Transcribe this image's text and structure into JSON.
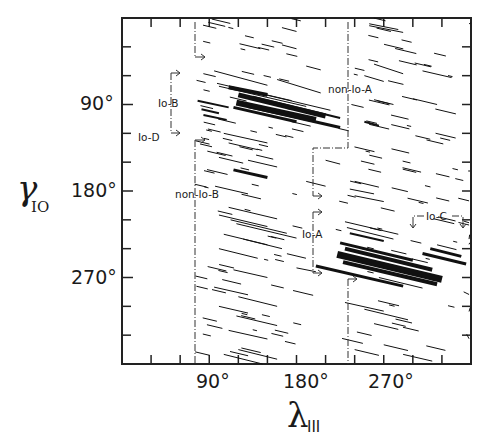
{
  "chart_data": {
    "type": "scatter",
    "title": "",
    "xlabel": "λIII",
    "xlabel_symbol": "λ",
    "xlabel_subscript": "III",
    "ylabel": "γIO",
    "ylabel_symbol": "γ",
    "ylabel_subscript": "IO",
    "xlim": [
      0,
      360
    ],
    "ylim": [
      360,
      0
    ],
    "y_inverted": true,
    "grid": false,
    "legend": null,
    "x_ticks": [
      {
        "value": 90,
        "label": "90°"
      },
      {
        "value": 180,
        "label": "180°"
      },
      {
        "value": 270,
        "label": "270°"
      }
    ],
    "y_ticks": [
      {
        "value": 90,
        "label": "90°"
      },
      {
        "value": 180,
        "label": "180°"
      },
      {
        "value": 270,
        "label": "270°"
      }
    ],
    "minor_tick_step": 30,
    "regions": [
      {
        "name": "Io-A",
        "lambda_range": [
          200,
          270
        ],
        "gamma_range": [
          220,
          290
        ]
      },
      {
        "name": "Io-B",
        "lambda_range": [
          100,
          180
        ],
        "gamma_range": [
          60,
          100
        ]
      },
      {
        "name": "Io-C",
        "lambda_range": [
          300,
          350
        ],
        "gamma_range": [
          230,
          250
        ]
      },
      {
        "name": "Io-D",
        "lambda_range": [
          50,
          105
        ],
        "gamma_range": [
          95,
          125
        ]
      },
      {
        "name": "non-Io-A",
        "lambda_range": [
          225,
          360
        ],
        "gamma_range": [
          0,
          360
        ]
      },
      {
        "name": "non-Io-B",
        "lambda_range": [
          75,
          180
        ],
        "gamma_range": [
          0,
          360
        ]
      }
    ],
    "annotations": [
      {
        "text": "Io-B",
        "lambda": 52,
        "gamma": 90
      },
      {
        "text": "Io-D",
        "lambda": 18,
        "gamma": 123
      },
      {
        "text": "non-Io-B",
        "lambda": 76,
        "gamma": 185
      },
      {
        "text": "non-Io-A",
        "lambda": 212,
        "gamma": 80
      },
      {
        "text": "Io-A",
        "lambda": 185,
        "gamma": 245
      },
      {
        "text": "Io-C",
        "lambda": 318,
        "gamma": 224
      }
    ],
    "strokes": [
      {
        "x1": 95,
        "y1": 55,
        "x2": 150,
        "y2": 70,
        "w": 1
      },
      {
        "x1": 98,
        "y1": 68,
        "x2": 175,
        "y2": 86,
        "w": 1
      },
      {
        "x1": 100,
        "y1": 71,
        "x2": 190,
        "y2": 92,
        "w": 1
      },
      {
        "x1": 110,
        "y1": 72,
        "x2": 150,
        "y2": 80,
        "w": 4
      },
      {
        "x1": 120,
        "y1": 80,
        "x2": 210,
        "y2": 102,
        "w": 5
      },
      {
        "x1": 118,
        "y1": 88,
        "x2": 200,
        "y2": 106,
        "w": 6
      },
      {
        "x1": 115,
        "y1": 93,
        "x2": 180,
        "y2": 108,
        "w": 3
      },
      {
        "x1": 130,
        "y1": 92,
        "x2": 225,
        "y2": 114,
        "w": 3
      },
      {
        "x1": 135,
        "y1": 82,
        "x2": 225,
        "y2": 104,
        "w": 2
      },
      {
        "x1": 78,
        "y1": 86,
        "x2": 110,
        "y2": 93,
        "w": 2
      },
      {
        "x1": 82,
        "y1": 95,
        "x2": 100,
        "y2": 99,
        "w": 2
      },
      {
        "x1": 84,
        "y1": 101,
        "x2": 108,
        "y2": 106,
        "w": 2
      },
      {
        "x1": 140,
        "y1": 78,
        "x2": 215,
        "y2": 96,
        "w": 1
      },
      {
        "x1": 160,
        "y1": 64,
        "x2": 205,
        "y2": 78,
        "w": 1
      },
      {
        "x1": 105,
        "y1": 120,
        "x2": 150,
        "y2": 130,
        "w": 1
      },
      {
        "x1": 110,
        "y1": 130,
        "x2": 140,
        "y2": 137,
        "w": 1
      },
      {
        "x1": 115,
        "y1": 158,
        "x2": 150,
        "y2": 166,
        "w": 3
      },
      {
        "x1": 100,
        "y1": 145,
        "x2": 125,
        "y2": 151,
        "w": 1
      },
      {
        "x1": 130,
        "y1": 148,
        "x2": 160,
        "y2": 155,
        "w": 1
      },
      {
        "x1": 96,
        "y1": 175,
        "x2": 130,
        "y2": 183,
        "w": 1
      },
      {
        "x1": 110,
        "y1": 197,
        "x2": 160,
        "y2": 209,
        "w": 1
      },
      {
        "x1": 100,
        "y1": 205,
        "x2": 150,
        "y2": 217,
        "w": 1
      },
      {
        "x1": 112,
        "y1": 210,
        "x2": 170,
        "y2": 224,
        "w": 1
      },
      {
        "x1": 118,
        "y1": 214,
        "x2": 180,
        "y2": 229,
        "w": 1
      },
      {
        "x1": 105,
        "y1": 225,
        "x2": 150,
        "y2": 236,
        "w": 1
      },
      {
        "x1": 125,
        "y1": 230,
        "x2": 165,
        "y2": 240,
        "w": 1
      },
      {
        "x1": 100,
        "y1": 240,
        "x2": 140,
        "y2": 250,
        "w": 1
      },
      {
        "x1": 115,
        "y1": 262,
        "x2": 150,
        "y2": 270,
        "w": 1
      },
      {
        "x1": 95,
        "y1": 280,
        "x2": 130,
        "y2": 288,
        "w": 1
      },
      {
        "x1": 120,
        "y1": 290,
        "x2": 160,
        "y2": 300,
        "w": 1
      },
      {
        "x1": 100,
        "y1": 300,
        "x2": 130,
        "y2": 307,
        "w": 1
      },
      {
        "x1": 118,
        "y1": 310,
        "x2": 160,
        "y2": 320,
        "w": 1
      },
      {
        "x1": 110,
        "y1": 325,
        "x2": 150,
        "y2": 334,
        "w": 1
      },
      {
        "x1": 120,
        "y1": 345,
        "x2": 160,
        "y2": 355,
        "w": 1
      },
      {
        "x1": 105,
        "y1": 350,
        "x2": 145,
        "y2": 360,
        "w": 1
      },
      {
        "x1": 165,
        "y1": 28,
        "x2": 180,
        "y2": 32,
        "w": 1
      },
      {
        "x1": 190,
        "y1": 50,
        "x2": 205,
        "y2": 54,
        "w": 1
      },
      {
        "x1": 165,
        "y1": 10,
        "x2": 180,
        "y2": 14,
        "w": 1
      },
      {
        "x1": 210,
        "y1": 148,
        "x2": 225,
        "y2": 152,
        "w": 1
      },
      {
        "x1": 190,
        "y1": 170,
        "x2": 210,
        "y2": 175,
        "w": 1
      },
      {
        "x1": 180,
        "y1": 260,
        "x2": 200,
        "y2": 264,
        "w": 1
      },
      {
        "x1": 255,
        "y1": 8,
        "x2": 290,
        "y2": 15,
        "w": 1
      },
      {
        "x1": 255,
        "y1": 6,
        "x2": 285,
        "y2": 12,
        "w": 1
      },
      {
        "x1": 260,
        "y1": 48,
        "x2": 290,
        "y2": 58,
        "w": 1
      },
      {
        "x1": 250,
        "y1": 60,
        "x2": 270,
        "y2": 66,
        "w": 1
      },
      {
        "x1": 310,
        "y1": 55,
        "x2": 340,
        "y2": 62,
        "w": 1
      },
      {
        "x1": 300,
        "y1": 84,
        "x2": 325,
        "y2": 90,
        "w": 1
      },
      {
        "x1": 260,
        "y1": 85,
        "x2": 280,
        "y2": 90,
        "w": 1
      },
      {
        "x1": 250,
        "y1": 108,
        "x2": 265,
        "y2": 112,
        "w": 2
      },
      {
        "x1": 240,
        "y1": 170,
        "x2": 265,
        "y2": 176,
        "w": 1
      },
      {
        "x1": 235,
        "y1": 178,
        "x2": 260,
        "y2": 183,
        "w": 1
      },
      {
        "x1": 240,
        "y1": 185,
        "x2": 270,
        "y2": 191,
        "w": 1
      },
      {
        "x1": 230,
        "y1": 212,
        "x2": 285,
        "y2": 225,
        "w": 1
      },
      {
        "x1": 232,
        "y1": 218,
        "x2": 280,
        "y2": 230,
        "w": 1
      },
      {
        "x1": 235,
        "y1": 224,
        "x2": 270,
        "y2": 232,
        "w": 2
      },
      {
        "x1": 225,
        "y1": 234,
        "x2": 300,
        "y2": 252,
        "w": 3
      },
      {
        "x1": 230,
        "y1": 240,
        "x2": 320,
        "y2": 262,
        "w": 4
      },
      {
        "x1": 222,
        "y1": 246,
        "x2": 330,
        "y2": 272,
        "w": 7
      },
      {
        "x1": 228,
        "y1": 254,
        "x2": 325,
        "y2": 277,
        "w": 4
      },
      {
        "x1": 200,
        "y1": 258,
        "x2": 290,
        "y2": 279,
        "w": 3
      },
      {
        "x1": 265,
        "y1": 270,
        "x2": 310,
        "y2": 281,
        "w": 1
      },
      {
        "x1": 310,
        "y1": 245,
        "x2": 355,
        "y2": 256,
        "w": 3
      },
      {
        "x1": 318,
        "y1": 240,
        "x2": 350,
        "y2": 248,
        "w": 3
      },
      {
        "x1": 325,
        "y1": 236,
        "x2": 345,
        "y2": 241,
        "w": 1
      },
      {
        "x1": 230,
        "y1": 296,
        "x2": 270,
        "y2": 305,
        "w": 1
      },
      {
        "x1": 250,
        "y1": 303,
        "x2": 295,
        "y2": 314,
        "w": 1
      },
      {
        "x1": 260,
        "y1": 318,
        "x2": 285,
        "y2": 324,
        "w": 1
      },
      {
        "x1": 270,
        "y1": 340,
        "x2": 295,
        "y2": 346,
        "w": 1
      },
      {
        "x1": 240,
        "y1": 345,
        "x2": 265,
        "y2": 351,
        "w": 1
      },
      {
        "x1": 290,
        "y1": 350,
        "x2": 320,
        "y2": 357,
        "w": 1
      }
    ]
  },
  "labels": {
    "y_axis_symbol": "γ",
    "y_axis_sub": "IO",
    "x_axis_symbol": "λ",
    "x_axis_sub": "III",
    "io_a": "Io-A",
    "io_b": "Io-B",
    "io_c": "Io-C",
    "io_d": "Io-D",
    "non_io_a": "non-Io-A",
    "non_io_b": "non-Io-B"
  }
}
